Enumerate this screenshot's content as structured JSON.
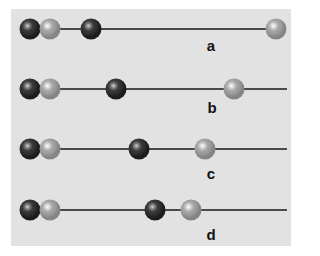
{
  "diagram": {
    "colors": {
      "background": "#e2e2e2",
      "line": "#4a4a4a",
      "dark_bead": "#2a2a2a",
      "light_bead": "#9a9a9a"
    },
    "rows": [
      {
        "label": "a",
        "y": 29,
        "line_start": 30,
        "line_end": 276,
        "beads": [
          {
            "type": "dark",
            "x": 30
          },
          {
            "type": "light",
            "x": 50
          },
          {
            "type": "dark",
            "x": 91
          },
          {
            "type": "light",
            "x": 276
          }
        ],
        "label_pos": {
          "x": 211,
          "y": 45
        }
      },
      {
        "label": "b",
        "y": 89,
        "line_start": 30,
        "line_end": 287,
        "beads": [
          {
            "type": "dark",
            "x": 30
          },
          {
            "type": "light",
            "x": 50
          },
          {
            "type": "dark",
            "x": 116
          },
          {
            "type": "light",
            "x": 234
          }
        ],
        "label_pos": {
          "x": 212,
          "y": 107
        }
      },
      {
        "label": "c",
        "y": 149,
        "line_start": 30,
        "line_end": 287,
        "beads": [
          {
            "type": "dark",
            "x": 30
          },
          {
            "type": "light",
            "x": 50
          },
          {
            "type": "dark",
            "x": 139
          },
          {
            "type": "light",
            "x": 205
          }
        ],
        "label_pos": {
          "x": 211,
          "y": 173
        }
      },
      {
        "label": "d",
        "y": 210,
        "line_start": 30,
        "line_end": 287,
        "beads": [
          {
            "type": "dark",
            "x": 30
          },
          {
            "type": "light",
            "x": 50
          },
          {
            "type": "dark",
            "x": 155
          },
          {
            "type": "light",
            "x": 191
          }
        ],
        "label_pos": {
          "x": 211,
          "y": 234
        }
      }
    ]
  }
}
